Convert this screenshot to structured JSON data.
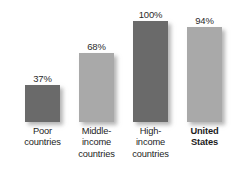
{
  "chart_data": {
    "type": "bar",
    "title": "",
    "subtitle": "",
    "xlabel": "",
    "ylabel": "",
    "categories": [
      "Poor countries",
      "Middle-income countries",
      "High-income countries",
      "United States"
    ],
    "values": [
      37,
      68,
      100,
      94
    ],
    "value_labels": [
      "37%",
      "68%",
      "100%",
      "94%"
    ],
    "ylim": [
      0,
      100
    ],
    "grid": false,
    "legend": null,
    "series": [
      {
        "name": "",
        "values": [
          37,
          68,
          100,
          94
        ]
      }
    ],
    "bar_colors": [
      "#6a6a6a",
      "#a9a9a9",
      "#6a6a6a",
      "#a9a9a9"
    ],
    "background": "#ffffff"
  },
  "bars": [
    {
      "value_label": "37%",
      "value": 37,
      "color_key": "bar-dark",
      "color": "#6a6a6a",
      "emphasis": false,
      "label_lines": [
        "Poor",
        "countries"
      ]
    },
    {
      "value_label": "68%",
      "value": 68,
      "color_key": "bar-light",
      "color": "#a9a9a9",
      "emphasis": false,
      "label_lines": [
        "Middle-",
        "income",
        "countries"
      ]
    },
    {
      "value_label": "100%",
      "value": 100,
      "color_key": "bar-dark",
      "color": "#6a6a6a",
      "emphasis": false,
      "label_lines": [
        "High-",
        "income",
        "countries"
      ]
    },
    {
      "value_label": "94%",
      "value": 94,
      "color_key": "bar-light",
      "color": "#a9a9a9",
      "emphasis": true,
      "label_lines": [
        "United",
        "States"
      ]
    }
  ]
}
